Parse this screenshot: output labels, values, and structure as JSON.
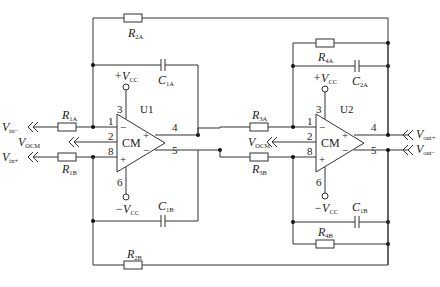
{
  "diagram": {
    "amplifiers": [
      {
        "id": "U1",
        "label": "U1",
        "core_label": "CM",
        "pins": {
          "inv_in": "1",
          "vocm": "2",
          "noninv_in": "8",
          "vplus": "3",
          "vminus": "6",
          "out_pos": "4",
          "out_neg": "5"
        },
        "vplus_label": "+V",
        "vplus_sub": "CC",
        "vminus_label": "−V",
        "vminus_sub": "CC",
        "in_minus_sign": "−",
        "in_plus_sign": "+",
        "out_plus_sign": "+",
        "out_minus_sign": "−"
      },
      {
        "id": "U2",
        "label": "U2",
        "core_label": "CM",
        "pins": {
          "inv_in": "1",
          "vocm": "2",
          "noninv_in": "8",
          "vplus": "3",
          "vminus": "6",
          "out_pos": "4",
          "out_neg": "5"
        },
        "vplus_label": "+V",
        "vplus_sub": "CC",
        "vminus_label": "−V",
        "vminus_sub": "CC",
        "in_minus_sign": "−",
        "in_plus_sign": "+",
        "out_plus_sign": "+",
        "out_minus_sign": "−"
      }
    ],
    "resistors": [
      {
        "id": "R1A",
        "label": "R",
        "sub": "1A"
      },
      {
        "id": "R1B",
        "label": "R",
        "sub": "1B"
      },
      {
        "id": "R2A",
        "label": "R",
        "sub": "2A"
      },
      {
        "id": "R2B",
        "label": "R",
        "sub": "2B"
      },
      {
        "id": "R3A",
        "label": "R",
        "sub": "3A"
      },
      {
        "id": "R3B",
        "label": "R",
        "sub": "3B"
      },
      {
        "id": "R4A",
        "label": "R",
        "sub": "4A"
      },
      {
        "id": "R4B",
        "label": "R",
        "sub": "4B"
      }
    ],
    "capacitors": [
      {
        "id": "C1A",
        "label": "C",
        "sub": "1A"
      },
      {
        "id": "C1B",
        "label": "C",
        "sub": "1B"
      },
      {
        "id": "C2A",
        "label": "C",
        "sub": "2A"
      },
      {
        "id": "C1B_stage2",
        "label": "C",
        "sub": "1B"
      }
    ],
    "ports": {
      "vin_minus": {
        "label": "V",
        "sub": "in−"
      },
      "vin_plus": {
        "label": "V",
        "sub": "in+"
      },
      "vocm_1": {
        "label": "V",
        "sub": "OCM"
      },
      "vocm_2": {
        "label": "V",
        "sub": "OCM"
      },
      "vout_plus": {
        "label": "V",
        "sub": "out+"
      },
      "vout_minus": {
        "label": "V",
        "sub": "out−"
      }
    },
    "colors": {
      "line": "#333333",
      "background": "#ffffff"
    }
  }
}
